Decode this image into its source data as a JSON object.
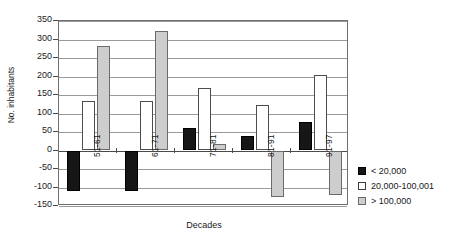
{
  "chart_data": {
    "type": "bar",
    "title": "",
    "xlabel": "Decades",
    "ylabel": "No. inhabitants",
    "categories": [
      "51-61",
      "61-71",
      "71-81",
      "81-91",
      "91-97"
    ],
    "series": [
      {
        "name": "< 20,000",
        "color": "#161616",
        "values": [
          -110,
          -110,
          60,
          38,
          78
        ]
      },
      {
        "name": "20,000-100,001",
        "color": "#ffffff",
        "values": [
          135,
          135,
          170,
          123,
          203
        ]
      },
      {
        "name": "> 100,000",
        "color": "#cdcdcd",
        "values": [
          283,
          323,
          17,
          -125,
          -120
        ]
      }
    ],
    "ylim": [
      -150,
      350
    ],
    "ytick_values": [
      350,
      300,
      250,
      200,
      150,
      100,
      50,
      0,
      -50,
      -100,
      -150
    ],
    "ytick_labels": [
      "350",
      "300",
      "250",
      "200",
      "150",
      "100",
      "50",
      "0",
      "-50",
      "-100",
      "-150"
    ],
    "grid": true,
    "legend_position": "right"
  },
  "legend": {
    "items": [
      {
        "label": "< 20,000"
      },
      {
        "label": "20,000-100,001"
      },
      {
        "label": "> 100,000"
      }
    ]
  }
}
